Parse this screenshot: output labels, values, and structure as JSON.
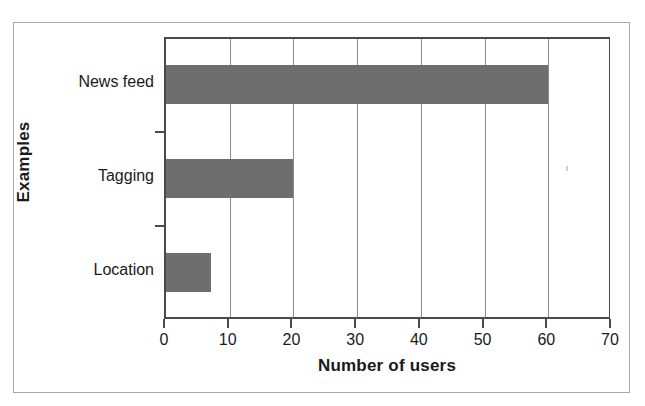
{
  "chart_data": {
    "type": "bar",
    "orientation": "horizontal",
    "title": "",
    "xlabel": "Number of users",
    "ylabel": "Examples",
    "categories": [
      "News feed",
      "Tagging",
      "Location"
    ],
    "values": [
      60,
      20,
      7
    ],
    "series": [
      {
        "name": "Number of users",
        "values": [
          60,
          20,
          7
        ]
      }
    ],
    "xlim": [
      0,
      70
    ],
    "xticks": [
      0,
      10,
      20,
      30,
      40,
      50,
      60,
      70
    ],
    "xtick_labels": [
      "0",
      "10",
      "20",
      "30",
      "40",
      "50",
      "60",
      "70"
    ],
    "grid": "vertical",
    "legend": "none",
    "bar_color": "#6e6e6e",
    "axis_color": "#4a4a4a",
    "gridline_color": "#8c8c8c",
    "background_color": "#ffffff",
    "frame_color": "#a8a8a8"
  }
}
